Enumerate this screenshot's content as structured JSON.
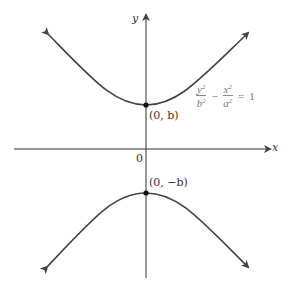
{
  "figure": {
    "equation": {
      "term1_num": "y",
      "term1_num_exp": "2",
      "term1_den": "b",
      "term1_den_exp": "2",
      "operator": "−",
      "term2_num": "x",
      "term2_num_exp": "2",
      "term2_den": "a",
      "term2_den_exp": "2",
      "equals": "=",
      "rhs": "1"
    },
    "axes": {
      "x_label": "x",
      "y_label": "y",
      "origin_label": "0"
    },
    "points": [
      {
        "label": "(0, b)",
        "x": 0,
        "y": "b"
      },
      {
        "label": "(0, −b)",
        "x": 0,
        "y": "-b"
      }
    ],
    "colors": {
      "curve": "#444444",
      "axis": "#333333",
      "equation_text": "#777777"
    }
  }
}
